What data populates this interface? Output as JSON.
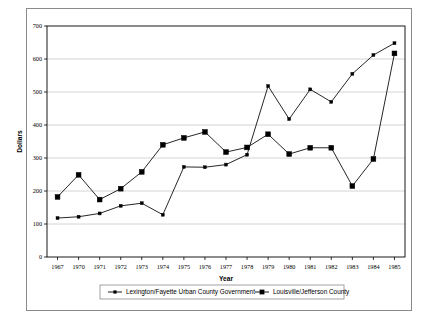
{
  "chart_data": {
    "type": "line",
    "title": "",
    "xlabel": "Year",
    "ylabel": "Dollars",
    "ylim": [
      0,
      700
    ],
    "ytick_step": 100,
    "yticks": [
      "0",
      "100",
      "200",
      "300",
      "400",
      "500",
      "600",
      "700"
    ],
    "grid": "horizontal",
    "legend_position": "bottom",
    "categories": [
      "1967",
      "1970",
      "1971",
      "1972",
      "1973",
      "1974",
      "1975",
      "1976",
      "1977",
      "1978",
      "1979",
      "1980",
      "1981",
      "1982",
      "1983",
      "1984",
      "1985"
    ],
    "series": [
      {
        "name": "Lexington/Fayette Urban County Government",
        "marker": "small-plus",
        "values": [
          118,
          122,
          132,
          155,
          163,
          128,
          273,
          272,
          280,
          310,
          518,
          418,
          508,
          470,
          555,
          612,
          648
        ]
      },
      {
        "name": "Louisville/Jefferson County",
        "marker": "filled-square",
        "values": [
          182,
          249,
          174,
          207,
          258,
          340,
          361,
          379,
          318,
          332,
          372,
          312,
          331,
          331,
          215,
          297,
          617
        ]
      }
    ],
    "colors": {
      "series_line": "#000000",
      "grid": "#c9c9c9",
      "axis": "#000000",
      "frame": "#8a8a8a",
      "background": "#ffffff"
    }
  }
}
